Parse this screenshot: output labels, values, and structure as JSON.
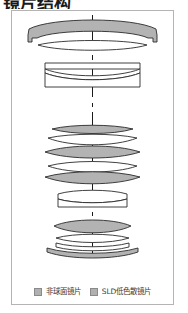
{
  "title": "镜片结构",
  "frame": {
    "border_color": "#b4b4b4"
  },
  "diagram": {
    "name": "lens-cross-section-diagram",
    "axis_label": "optical-axis",
    "axis_color": "#1a1a1a",
    "outline_color": "#2b2b2b",
    "shaded_fill": "#b3b3b3",
    "clear_fill": "#ffffff",
    "groups": [
      {
        "name": "front-group",
        "elements": [
          {
            "id": "e1",
            "type": "meniscus",
            "shading": "shaded",
            "note": "large front aspherical element with barrel flange"
          },
          {
            "id": "e2",
            "type": "meniscus",
            "shading": "clear",
            "note": "thin second element"
          }
        ]
      },
      {
        "name": "second-group",
        "elements": [
          {
            "id": "e3",
            "type": "plano",
            "shading": "clear"
          },
          {
            "id": "e4",
            "type": "meniscus",
            "shading": "clear"
          },
          {
            "id": "e5",
            "type": "meniscus",
            "shading": "clear"
          }
        ]
      },
      {
        "name": "middle-group",
        "elements": [
          {
            "id": "e6",
            "type": "biconvex",
            "shading": "shaded"
          },
          {
            "id": "e7",
            "type": "meniscus",
            "shading": "clear"
          },
          {
            "id": "e8",
            "type": "biconvex",
            "shading": "shaded"
          },
          {
            "id": "e9",
            "type": "meniscus",
            "shading": "clear"
          },
          {
            "id": "e10",
            "type": "biconvex",
            "shading": "shaded"
          }
        ]
      },
      {
        "name": "aperture-group",
        "elements": [
          {
            "id": "e11",
            "type": "doublet",
            "shading": "clear"
          },
          {
            "id": "e12",
            "type": "doublet",
            "shading": "clear"
          }
        ]
      },
      {
        "name": "rear-group",
        "elements": [
          {
            "id": "e13",
            "type": "biconvex",
            "shading": "shaded"
          },
          {
            "id": "e14",
            "type": "meniscus",
            "shading": "clear"
          },
          {
            "id": "e15",
            "type": "meniscus",
            "shading": "clear"
          },
          {
            "id": "e16",
            "type": "meniscus",
            "shading": "shaded"
          }
        ]
      }
    ]
  },
  "legend": {
    "items": [
      {
        "label": "非球面镜片",
        "swatch_color": "#b0b0b0"
      },
      {
        "label": "SLD低色散镜片",
        "swatch_color": "#b0b0b0"
      }
    ]
  }
}
